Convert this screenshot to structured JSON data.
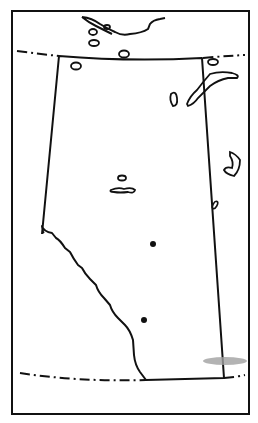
{
  "map": {
    "region": "Alberta outline",
    "colors": {
      "background": "#ffffff",
      "line": "#111111",
      "smudge": "#a0a0a0"
    },
    "markers": [
      {
        "name": "city-marker-north",
        "x": 153,
        "y": 244
      },
      {
        "name": "city-marker-south",
        "x": 144,
        "y": 320
      }
    ]
  }
}
